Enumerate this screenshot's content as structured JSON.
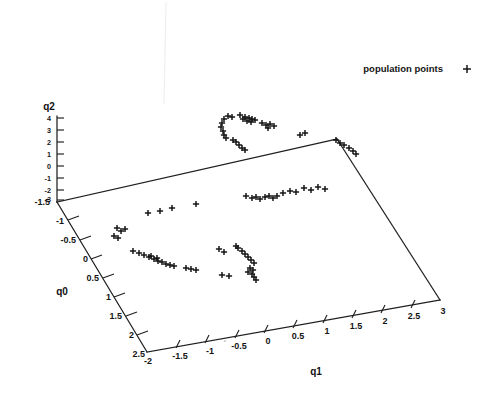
{
  "legend": {
    "label": "population points",
    "marker": "plus-marker",
    "marker_glyph": "+",
    "color": "#101010"
  },
  "axes": {
    "q0": {
      "title": "q0",
      "ticks": [
        "-1.5",
        "-1",
        "-0.5",
        "0",
        "0.5",
        "1",
        "1.5",
        "2",
        "2.5"
      ],
      "range": [
        -1.5,
        2.5
      ],
      "step": 0.5
    },
    "q1": {
      "title": "q1",
      "ticks": [
        "-2",
        "-1.5",
        "-1",
        "-0.5",
        "0",
        "0.5",
        "1",
        "1.5",
        "2",
        "2.5",
        "3"
      ],
      "range": [
        -2,
        3
      ],
      "step": 0.5
    },
    "q2": {
      "title": "q2",
      "ticks": [
        "4",
        "3",
        "2",
        "1",
        "0",
        "-1",
        "-2",
        "-3"
      ],
      "range": [
        -3,
        4
      ],
      "step": 1
    },
    "origin_label": "-1.5"
  },
  "chart_data": {
    "type": "scatter",
    "title": "",
    "xlabel": "q1",
    "ylabel": "q0",
    "zlabel": "q2",
    "projection": "3d-oblique",
    "grid": false,
    "legend_position": "top-right",
    "series": [
      {
        "name": "population points",
        "marker": "+",
        "color": "#101010",
        "points_px": [
          [
            224,
            119
          ],
          [
            228,
            116
          ],
          [
            232,
            117
          ],
          [
            222,
            123
          ],
          [
            221,
            127
          ],
          [
            223,
            131
          ],
          [
            224,
            135
          ],
          [
            226,
            138
          ],
          [
            240,
            115
          ],
          [
            245,
            117
          ],
          [
            249,
            118
          ],
          [
            252,
            119
          ],
          [
            255,
            120
          ],
          [
            247,
            121
          ],
          [
            251,
            122
          ],
          [
            243,
            119
          ],
          [
            262,
            123
          ],
          [
            266,
            125
          ],
          [
            270,
            124
          ],
          [
            274,
            126
          ],
          [
            268,
            128
          ],
          [
            300,
            135
          ],
          [
            305,
            133
          ],
          [
            236,
            142
          ],
          [
            239,
            145
          ],
          [
            242,
            148
          ],
          [
            245,
            150
          ],
          [
            233,
            140
          ],
          [
            344,
            145
          ],
          [
            349,
            148
          ],
          [
            353,
            151
          ],
          [
            356,
            154
          ],
          [
            336,
            140
          ],
          [
            340,
            143
          ],
          [
            246,
            196
          ],
          [
            252,
            198
          ],
          [
            256,
            197
          ],
          [
            260,
            199
          ],
          [
            265,
            197
          ],
          [
            269,
            196
          ],
          [
            273,
            198
          ],
          [
            277,
            196
          ],
          [
            283,
            193
          ],
          [
            290,
            191
          ],
          [
            296,
            192
          ],
          [
            304,
            188
          ],
          [
            311,
            190
          ],
          [
            318,
            187
          ],
          [
            325,
            189
          ],
          [
            148,
            213
          ],
          [
            160,
            211
          ],
          [
            172,
            208
          ],
          [
            196,
            204
          ],
          [
            117,
            228
          ],
          [
            121,
            231
          ],
          [
            125,
            229
          ],
          [
            114,
            236
          ],
          [
            118,
            238
          ],
          [
            133,
            251
          ],
          [
            139,
            253
          ],
          [
            144,
            255
          ],
          [
            149,
            257
          ],
          [
            154,
            259
          ],
          [
            158,
            261
          ],
          [
            162,
            262
          ],
          [
            166,
            264
          ],
          [
            170,
            265
          ],
          [
            174,
            266
          ],
          [
            151,
            256
          ],
          [
            157,
            258
          ],
          [
            186,
            268
          ],
          [
            191,
            269
          ],
          [
            196,
            270
          ],
          [
            219,
            249
          ],
          [
            224,
            252
          ],
          [
            238,
            248
          ],
          [
            242,
            251
          ],
          [
            245,
            254
          ],
          [
            248,
            257
          ],
          [
            251,
            260
          ],
          [
            254,
            263
          ],
          [
            236,
            246
          ],
          [
            222,
            275
          ],
          [
            229,
            276
          ],
          [
            248,
            272
          ],
          [
            252,
            274
          ],
          [
            254,
            277
          ],
          [
            256,
            280
          ],
          [
            250,
            268
          ],
          [
            253,
            270
          ]
        ],
        "count": 88
      }
    ]
  },
  "artifacts": {
    "scan_line": "faint-vertical-scan-line",
    "speck": "small-gray-speck"
  }
}
